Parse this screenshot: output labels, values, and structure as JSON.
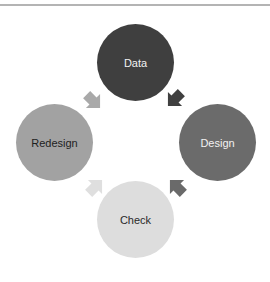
{
  "diagram": {
    "type": "cycle",
    "nodes": [
      {
        "id": "data",
        "label": "Data",
        "color": "#3f3f3f",
        "text_color": "#f2f2f2"
      },
      {
        "id": "design",
        "label": "Design",
        "color": "#6b6b6b",
        "text_color": "#f2f2f2"
      },
      {
        "id": "check",
        "label": "Check",
        "color": "#dddddd",
        "text_color": "#2a2a2a"
      },
      {
        "id": "redesign",
        "label": "Redesign",
        "color": "#a2a2a2",
        "text_color": "#1e1e1e"
      }
    ],
    "arrows": [
      {
        "from": "Data",
        "to": "Design",
        "color": "#404040"
      },
      {
        "from": "Design",
        "to": "Check",
        "color": "#6a6a6a"
      },
      {
        "from": "Check",
        "to": "Redesign",
        "color": "#dfdfdf"
      },
      {
        "from": "Redesign",
        "to": "Data",
        "color": "#a9a9a9"
      }
    ]
  }
}
